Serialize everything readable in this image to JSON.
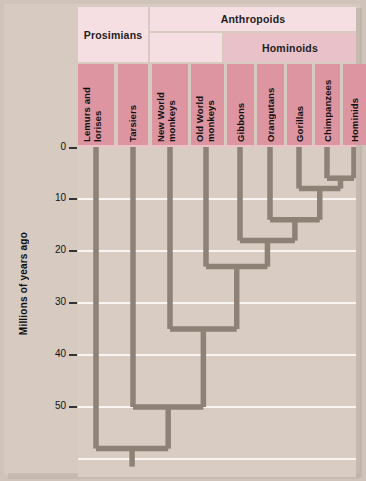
{
  "figure": {
    "type": "cladogram",
    "axis_label": "Millions of years ago",
    "axis_ticks": [
      "0",
      "10",
      "20",
      "30",
      "40",
      "50"
    ],
    "axis_range": [
      0,
      60
    ]
  },
  "groups": [
    {
      "id": "prosimians",
      "label": "Prosimians"
    },
    {
      "id": "anthropoids",
      "label": "Anthropoids"
    },
    {
      "id": "hominoids",
      "label": "Hominoids"
    }
  ],
  "taxa": [
    {
      "id": "lemurs",
      "label": "Lemurs and\nlorises"
    },
    {
      "id": "tarsiers",
      "label": "Tarsiers"
    },
    {
      "id": "nwmonkeys",
      "label": "New World\nmonkeys"
    },
    {
      "id": "owmonkeys",
      "label": "Old World\nmonkeys"
    },
    {
      "id": "gibbons",
      "label": "Gibbons"
    },
    {
      "id": "orangutans",
      "label": "Orangutans"
    },
    {
      "id": "gorillas",
      "label": "Gorillas"
    },
    {
      "id": "chimps",
      "label": "Chimpanzees"
    },
    {
      "id": "hominids",
      "label": "Hominids"
    }
  ],
  "chart_data": {
    "type": "tree",
    "title": "",
    "xlabel": "",
    "ylabel": "Millions of years ago",
    "ylim": [
      0,
      64
    ],
    "yticks": [
      0,
      10,
      20,
      30,
      40,
      50
    ],
    "grid": true,
    "tips": [
      {
        "taxon": "Lemurs and lorises",
        "age": 0
      },
      {
        "taxon": "Tarsiers",
        "age": 0
      },
      {
        "taxon": "New World monkeys",
        "age": 0
      },
      {
        "taxon": "Old World monkeys",
        "age": 0
      },
      {
        "taxon": "Gibbons",
        "age": 0
      },
      {
        "taxon": "Orangutans",
        "age": 0
      },
      {
        "taxon": "Gorillas",
        "age": 0
      },
      {
        "taxon": "Chimpanzees",
        "age": 0
      },
      {
        "taxon": "Hominids",
        "age": 0
      }
    ],
    "nodes": [
      {
        "name": "Chimpanzees + Hominids",
        "age": 6,
        "children": [
          "Chimpanzees",
          "Hominids"
        ]
      },
      {
        "name": "Gorillas + (Chimps, Hominids)",
        "age": 8,
        "children": [
          "Gorillas",
          "Chimpanzees + Hominids"
        ]
      },
      {
        "name": "Orangutans + great apes",
        "age": 14,
        "children": [
          "Orangutans",
          "Gorillas + (Chimps, Hominids)"
        ]
      },
      {
        "name": "Gibbons + other hominoids",
        "age": 18,
        "children": [
          "Gibbons",
          "Orangutans + great apes"
        ]
      },
      {
        "name": "Old World monkeys + Hominoids",
        "age": 23,
        "children": [
          "Old World monkeys",
          "Gibbons + other hominoids"
        ]
      },
      {
        "name": "New World monkeys + catarrhines",
        "age": 35,
        "children": [
          "New World monkeys",
          "Old World monkeys + Hominoids"
        ]
      },
      {
        "name": "Tarsiers + Anthropoids",
        "age": 50,
        "children": [
          "Tarsiers",
          "New World monkeys + catarrhines"
        ]
      },
      {
        "name": "Root (Primates)",
        "age": 58,
        "children": [
          "Lemurs and lorises",
          "Tarsiers + Anthropoids"
        ]
      }
    ]
  },
  "colors": {
    "page_background": "#cfc3ba",
    "canvas": "#d6cac1",
    "plot_background": "#d8ccc3",
    "group_band": "#f6dfe3",
    "hominoid_band": "#e9c2c9",
    "taxon_band": "#dd95a2",
    "branch": "#8e8176",
    "gridline": "#fbf7f4",
    "text": "#111111"
  }
}
